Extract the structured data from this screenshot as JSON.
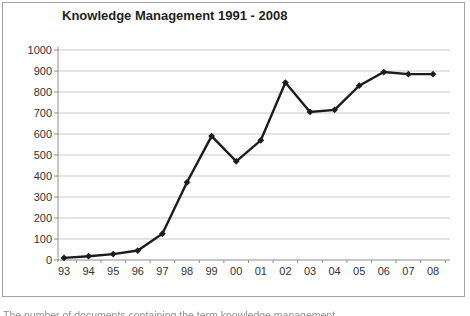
{
  "window": {
    "width": 470,
    "height": 316
  },
  "title": "Knowledge Management 1991 - 2008",
  "caption_fragment": "The number of documents containing the term knowledge management",
  "colors": {
    "line": "#1c1c1c",
    "marker": "#1c1c1c",
    "grid": "#c9c9c9",
    "axis": "#8e8e8e",
    "tick_label": "#333333",
    "frame_border": "#a3a3a3",
    "title_text": "#1f1f1f"
  },
  "chart_data": {
    "type": "line",
    "title": "Knowledge Management 1991 - 2008",
    "categories": [
      "93",
      "94",
      "95",
      "96",
      "97",
      "98",
      "99",
      "00",
      "01",
      "02",
      "03",
      "04",
      "05",
      "06",
      "07",
      "08"
    ],
    "values": [
      10,
      18,
      28,
      45,
      125,
      370,
      590,
      470,
      570,
      845,
      705,
      715,
      830,
      895,
      885,
      885
    ],
    "xlabel": "",
    "ylabel": "",
    "ylim": [
      0,
      1000
    ],
    "yticks": [
      0,
      100,
      200,
      300,
      400,
      500,
      600,
      700,
      800,
      900,
      1000
    ],
    "grid": "horizontal",
    "legend": "none",
    "marker": "diamond",
    "line_width": 2.4
  }
}
